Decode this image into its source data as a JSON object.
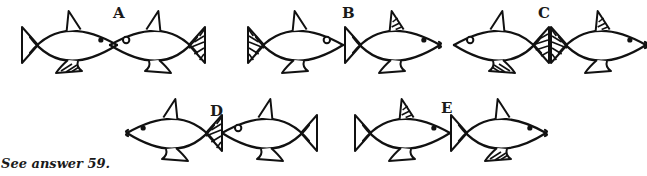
{
  "figure": {
    "caption": "See answer 59.",
    "panels": [
      {
        "label": "A",
        "label_pos": [
          113,
          6
        ],
        "fish": [
          {
            "dir": "right",
            "x": 22,
            "y": 45,
            "len": 95,
            "tail": "plain",
            "dorsal": "plain",
            "pelvic": "striped",
            "eye": "filled",
            "mouth": false
          },
          {
            "dir": "left",
            "x": 110,
            "y": 45,
            "len": 95,
            "tail": "striped",
            "dorsal": "plain",
            "pelvic": "plain",
            "eye": "open",
            "mouth": false
          }
        ]
      },
      {
        "label": "B",
        "label_pos": [
          342,
          6
        ],
        "fish": [
          {
            "dir": "right",
            "x": 248,
            "y": 45,
            "len": 95,
            "tail": "striped",
            "dorsal": "plain",
            "pelvic": "plain",
            "eye": "open",
            "mouth": false
          },
          {
            "dir": "right",
            "x": 345,
            "y": 45,
            "len": 95,
            "tail": "plain",
            "dorsal": "striped",
            "pelvic": "plain",
            "eye": "filled",
            "mouth": true
          }
        ]
      },
      {
        "label": "C",
        "label_pos": [
          538,
          6
        ],
        "fish": [
          {
            "dir": "left",
            "x": 454,
            "y": 45,
            "len": 95,
            "tail": "bold",
            "dorsal": "plain",
            "pelvic": "striped",
            "eye": "open",
            "mouth": false
          },
          {
            "dir": "right",
            "x": 551,
            "y": 45,
            "len": 95,
            "tail": "striped",
            "dorsal": "striped",
            "pelvic": "plain",
            "eye": "filled",
            "mouth": true
          }
        ]
      },
      {
        "label": "D",
        "label_pos": [
          210,
          104
        ],
        "fish": [
          {
            "dir": "left",
            "x": 127,
            "y": 133,
            "len": 95,
            "tail": "striped",
            "dorsal": "plain",
            "pelvic": "plain",
            "eye": "filled",
            "mouth": true
          },
          {
            "dir": "left",
            "x": 222,
            "y": 133,
            "len": 95,
            "tail": "plain",
            "dorsal": "plain",
            "pelvic": "plain",
            "eye": "open",
            "mouth": false
          }
        ]
      },
      {
        "label": "E",
        "label_pos": [
          441,
          101
        ],
        "fish": [
          {
            "dir": "right",
            "x": 355,
            "y": 133,
            "len": 95,
            "tail": "plain",
            "dorsal": "striped",
            "pelvic": "plain",
            "eye": "filled",
            "mouth": false
          },
          {
            "dir": "right",
            "x": 451,
            "y": 133,
            "len": 95,
            "tail": "plain",
            "dorsal": "plain",
            "pelvic": "striped",
            "eye": "filled",
            "mouth": true
          }
        ]
      }
    ]
  }
}
